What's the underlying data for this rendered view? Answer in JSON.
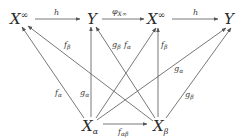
{
  "diagram": {
    "type": "commutative-diagram",
    "nodes": [
      {
        "id": "Xinf1",
        "base": "X",
        "sup": "∞",
        "x": 22,
        "y": 19
      },
      {
        "id": "Y1",
        "base": "Y",
        "x": 92,
        "y": 19
      },
      {
        "id": "Xinf2",
        "base": "X",
        "sup": "∞",
        "x": 158,
        "y": 19
      },
      {
        "id": "Y2",
        "base": "Y",
        "x": 229,
        "y": 19
      },
      {
        "id": "Xa",
        "base": "X",
        "sub": "α",
        "x": 90,
        "y": 128
      },
      {
        "id": "Xb",
        "base": "X",
        "sub": "β",
        "x": 160,
        "y": 128
      }
    ],
    "edges": [
      {
        "from": "Xinf1",
        "to": "Y1",
        "label": "h"
      },
      {
        "from": "Y1",
        "to": "Xinf2",
        "label": "φ",
        "label_sub": "X∞"
      },
      {
        "from": "Xinf2",
        "to": "Y2",
        "label": "h"
      },
      {
        "from": "Xa",
        "to": "Xinf1",
        "label": "f",
        "label_sub": "α"
      },
      {
        "from": "Xb",
        "to": "Xinf1",
        "label": "f",
        "label_sub": "β"
      },
      {
        "from": "Xa",
        "to": "Y1",
        "label": "g",
        "label_sub": "α"
      },
      {
        "from": "Xb",
        "to": "Y1",
        "label": "g",
        "label_sub": "β"
      },
      {
        "from": "Xa",
        "to": "Xinf2",
        "label": "f",
        "label_sub": "α"
      },
      {
        "from": "Xb",
        "to": "Xinf2",
        "label": "f",
        "label_sub": "β"
      },
      {
        "from": "Xa",
        "to": "Y2",
        "label": "g",
        "label_sub": "α"
      },
      {
        "from": "Xb",
        "to": "Y2",
        "label": "g",
        "label_sub": "β"
      },
      {
        "from": "Xa",
        "to": "Xb",
        "label": "f",
        "label_sub": "αβ"
      }
    ]
  },
  "text": {
    "X": "X",
    "Y": "Y",
    "inf": "∞",
    "alpha": "α",
    "beta": "β",
    "h": "h",
    "phi": "φ",
    "Xinf": "X∞",
    "f": "f",
    "g": "g",
    "ab": "αβ"
  }
}
